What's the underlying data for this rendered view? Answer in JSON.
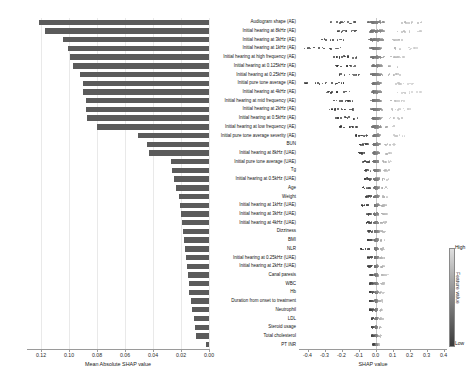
{
  "chart_data": {
    "type": "bar",
    "title": "",
    "subtitle": "",
    "panels": [
      "mean-absolute-shap-bar",
      "shap-beeswarm"
    ],
    "left_panel": {
      "xlabel": "Mean Absolute SHAP value",
      "xlim": [
        0.13,
        0.0
      ],
      "x_inverted": true,
      "ticks": [
        "0.12",
        "0.10",
        "0.08",
        "0.06",
        "0.04",
        "0.02",
        "0.00"
      ],
      "tick_values": [
        0.12,
        0.1,
        0.08,
        0.06,
        0.04,
        0.02,
        0.0
      ],
      "grid": true,
      "bar_color": "#5b5b5b"
    },
    "right_panel": {
      "xlabel": "SHAP value",
      "xlim": [
        -0.45,
        0.42
      ],
      "ticks": [
        "-0.4",
        "-0.3",
        "-0.2",
        "-0.1",
        "0.0",
        "0.1",
        "0.2",
        "0.3",
        "0.4"
      ],
      "tick_values": [
        -0.4,
        -0.3,
        -0.2,
        -0.1,
        0.0,
        0.1,
        0.2,
        0.3,
        0.4
      ],
      "grid": false,
      "zero_line": true
    },
    "colorbar": {
      "title": "Feature value",
      "high_label": "High",
      "low_label": "Low",
      "high_color": "#dfdfdf",
      "low_color": "#3a3a3a"
    },
    "categories": [
      "Audiogram shape (AE)",
      "Initial hearing at 8kHz (AE)",
      "Initial hearing at 3kHz (AE)",
      "Initial hearing at 1kHz (AE)",
      "Initial hearing at high frequency (AE)",
      "Initial hearing at 0.125kHz (AE)",
      "Initial hearing at 0.25kHz (AE)",
      "Initial pure tone average (AE)",
      "Initial hearing at 4kHz (AE)",
      "Initial hearing at mid frequency (AE)",
      "Initial hearing at 2kHz (AE)",
      "Initial hearing at 0.5kHz (AE)",
      "Initial hearing at low frequency (AE)",
      "Initial pure tone average severity (AE)",
      "BUN",
      "Initial hearing at 8kHz (UAE)",
      "Initial pure tone average (UAE)",
      "Tg",
      "Initial hearing at 0.5kHz (UAE)",
      "Age",
      "Weight",
      "Initial hearing at 1kHz (UAE)",
      "Initial hearing at 3kHz (UAE)",
      "Initial hearing at 4kHz (UAE)",
      "Dizziness",
      "BMI",
      "NLR",
      "Initial hearing at 0.25kHz (UAE)",
      "Initial hearing at 2kHz (UAE)",
      "Canal paresis",
      "WBC",
      "Hb",
      "Duration from onset to treatment",
      "Neutrophil",
      "LDL",
      "Steroid usage",
      "Total cholesterol",
      "PT INR"
    ],
    "values": [
      0.1215,
      0.117,
      0.1045,
      0.101,
      0.099,
      0.0975,
      0.092,
      0.09,
      0.09,
      0.088,
      0.088,
      0.087,
      0.08,
      0.0505,
      0.044,
      0.043,
      0.0275,
      0.0265,
      0.025,
      0.0235,
      0.0215,
      0.0205,
      0.02,
      0.0195,
      0.0185,
      0.018,
      0.0175,
      0.0165,
      0.016,
      0.015,
      0.0145,
      0.014,
      0.013,
      0.012,
      0.011,
      0.01,
      0.009,
      0.0025
    ],
    "beeswarm_spreads": [
      {
        "left": -0.27,
        "right": 0.29,
        "core": 0.09
      },
      {
        "left": -0.23,
        "right": 0.27,
        "core": 0.08
      },
      {
        "left": -0.33,
        "right": 0.17,
        "core": 0.07
      },
      {
        "left": -0.43,
        "right": 0.24,
        "core": 0.06
      },
      {
        "left": -0.25,
        "right": 0.18,
        "core": 0.06
      },
      {
        "left": -0.24,
        "right": 0.16,
        "core": 0.06
      },
      {
        "left": -0.22,
        "right": 0.15,
        "core": 0.06
      },
      {
        "left": -0.42,
        "right": 0.22,
        "core": 0.05
      },
      {
        "left": -0.3,
        "right": 0.27,
        "core": 0.05
      },
      {
        "left": -0.26,
        "right": 0.19,
        "core": 0.05
      },
      {
        "left": -0.28,
        "right": 0.2,
        "core": 0.05
      },
      {
        "left": -0.24,
        "right": 0.17,
        "core": 0.05
      },
      {
        "left": -0.22,
        "right": 0.12,
        "core": 0.05
      },
      {
        "left": -0.12,
        "right": 0.18,
        "core": 0.04
      },
      {
        "left": -0.1,
        "right": 0.11,
        "core": 0.035
      },
      {
        "left": -0.11,
        "right": 0.1,
        "core": 0.035
      },
      {
        "left": -0.08,
        "right": 0.09,
        "core": 0.03
      },
      {
        "left": -0.07,
        "right": 0.08,
        "core": 0.03
      },
      {
        "left": -0.07,
        "right": 0.08,
        "core": 0.03
      },
      {
        "left": -0.08,
        "right": 0.07,
        "core": 0.028
      },
      {
        "left": -0.06,
        "right": 0.07,
        "core": 0.026
      },
      {
        "left": -0.09,
        "right": 0.06,
        "core": 0.026
      },
      {
        "left": -0.06,
        "right": 0.07,
        "core": 0.024
      },
      {
        "left": -0.06,
        "right": 0.06,
        "core": 0.024
      },
      {
        "left": -0.05,
        "right": 0.06,
        "core": 0.022
      },
      {
        "left": -0.05,
        "right": 0.06,
        "core": 0.022
      },
      {
        "left": -0.09,
        "right": 0.05,
        "core": 0.02
      },
      {
        "left": -0.05,
        "right": 0.05,
        "core": 0.02
      },
      {
        "left": -0.05,
        "right": 0.05,
        "core": 0.02
      },
      {
        "left": -0.04,
        "right": 0.07,
        "core": 0.018
      },
      {
        "left": -0.04,
        "right": 0.05,
        "core": 0.018
      },
      {
        "left": -0.04,
        "right": 0.05,
        "core": 0.016
      },
      {
        "left": -0.04,
        "right": 0.04,
        "core": 0.016
      },
      {
        "left": -0.04,
        "right": 0.04,
        "core": 0.014
      },
      {
        "left": -0.03,
        "right": 0.04,
        "core": 0.014
      },
      {
        "left": -0.03,
        "right": 0.03,
        "core": 0.012
      },
      {
        "left": -0.03,
        "right": 0.03,
        "core": 0.012
      },
      {
        "left": -0.02,
        "right": 0.02,
        "core": 0.008
      }
    ]
  }
}
